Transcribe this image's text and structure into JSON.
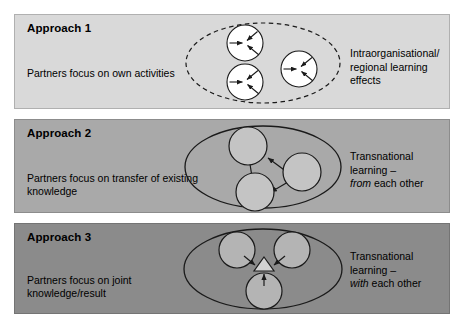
{
  "figure": {
    "background_color": "#ffffff",
    "width": 465,
    "height": 329
  },
  "panels": [
    {
      "id": "approach-1",
      "title": "Approach 1",
      "description": "Partners focus on own activities",
      "outcome_lines": [
        "Intraorganisational/",
        "regional learning",
        "effects"
      ],
      "outcome_plain": "Intraorganisational/ regional learning effects",
      "outcome_emphasis": "",
      "background_color": "#d9d9d9",
      "diagram": {
        "enclosure": "dashed-ellipse",
        "enclosure_style": "dashed",
        "node_count": 3,
        "node_shape": "circle",
        "node_fill": "#ffffff",
        "node_labels": [
          "partner-1",
          "partner-2",
          "partner-3"
        ],
        "arrows": "three inward arrows inside each circle",
        "arrow_direction": "inward-self",
        "center_shape": "none"
      }
    },
    {
      "id": "approach-2",
      "title": "Approach 2",
      "description": "Partners focus on transfer of existing knowledge",
      "outcome_lines": [
        "Transnational",
        "learning –",
        "from each other"
      ],
      "outcome_plain": "Transnational learning – from each other",
      "outcome_emphasis": "from",
      "background_color": "#a9a9a9",
      "diagram": {
        "enclosure": "solid-ellipse",
        "enclosure_style": "solid",
        "node_count": 3,
        "node_shape": "circle",
        "node_fill": "#c4c4c4",
        "node_labels": [
          "partner-top",
          "partner-right",
          "partner-bottom"
        ],
        "arrows": "right-to-top, top-to-bottom, right-to-bottom",
        "arrow_direction": "between-nodes",
        "center_shape": "none"
      }
    },
    {
      "id": "approach-3",
      "title": "Approach 3",
      "description": "Partners focus on joint knowledge/result",
      "outcome_lines": [
        "Transnational",
        "learning –",
        "with each other"
      ],
      "outcome_plain": "Transnational learning – with each other",
      "outcome_emphasis": "with",
      "background_color": "#8b8b8b",
      "diagram": {
        "enclosure": "solid-ellipse",
        "enclosure_style": "solid",
        "node_count": 3,
        "node_shape": "circle",
        "node_fill": "#b4b4b4",
        "node_labels": [
          "partner-top-left",
          "partner-top-right",
          "partner-bottom"
        ],
        "arrows": "all three nodes point inward to centre",
        "arrow_direction": "inward-to-centre",
        "center_shape": "triangle",
        "center_shape_label": "joint-result-triangle",
        "center_shape_fill": "#d2d2d2"
      }
    }
  ],
  "colors": {
    "panel_1": "#d9d9d9",
    "panel_2": "#a9a9a9",
    "panel_3": "#8b8b8b",
    "stroke": "#1a1a1a",
    "text": "#000000",
    "page_background": "#ffffff"
  }
}
